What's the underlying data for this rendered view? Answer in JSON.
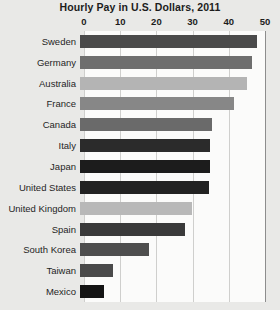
{
  "chart_data": {
    "type": "bar",
    "orientation": "horizontal",
    "title": "Hourly Pay in U.S. Dollars, 2011",
    "xlabel": "",
    "ylabel": "",
    "xlim": [
      0,
      50
    ],
    "xticks": [
      0,
      10,
      20,
      30,
      40,
      50
    ],
    "xtick_labels": [
      "0",
      "10",
      "20",
      "30",
      "40",
      "50"
    ],
    "grid": true,
    "grid_axis": "x",
    "legend": false,
    "categories": [
      "Sweden",
      "Germany",
      "Australia",
      "France",
      "Canada",
      "Italy",
      "Japan",
      "United States",
      "United Kingdom",
      "Spain",
      "South Korea",
      "Taiwan",
      "Mexico"
    ],
    "values": [
      49,
      47.5,
      46,
      42.5,
      36.5,
      36,
      36,
      35.5,
      31,
      29,
      19,
      9,
      6.5
    ],
    "bar_colors": [
      "#4a4a4a",
      "#6e6e6e",
      "#b4b4b4",
      "#878787",
      "#6a6a6a",
      "#2b2b2b",
      "#1c1c1c",
      "#222222",
      "#b8b8b8",
      "#3a3a3a",
      "#4e4e4e",
      "#4a4a4a",
      "#141414"
    ]
  },
  "colors": {
    "background": "#e9e9e7",
    "plot_background": "#fbfbfa",
    "gridline": "#cfcfcd",
    "axis_line": "#8d8d8d",
    "text": "#1c1c1c"
  }
}
